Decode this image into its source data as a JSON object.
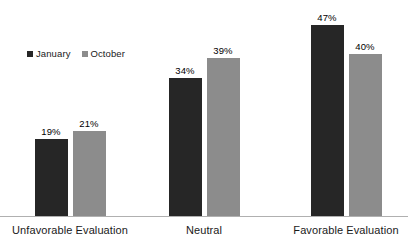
{
  "chart_data": {
    "type": "bar",
    "title": "",
    "subtitle": "",
    "xlabel": "",
    "ylabel": "",
    "ylim": [
      0,
      50
    ],
    "grid": false,
    "legend_position": "top-left",
    "categories": [
      "Unfavorable Evaluation",
      "Neutral",
      "Favorable Evaluation"
    ],
    "series": [
      {
        "name": "January",
        "color": "#262626",
        "values": [
          19,
          34,
          47
        ],
        "labels": [
          "19%",
          "34%",
          "47%"
        ]
      },
      {
        "name": "October",
        "color": "#8c8c8c",
        "values": [
          21,
          39,
          40
        ],
        "labels": [
          "21%",
          "39%",
          "40%"
        ]
      }
    ]
  },
  "legend": {
    "entries": [
      {
        "label": "January",
        "swatch": "legend-swatch-january"
      },
      {
        "label": "October",
        "swatch": "legend-swatch-october"
      }
    ]
  },
  "axis": {
    "baseline_color": "#b0b0b0"
  },
  "colors": {
    "january": "#262626",
    "october": "#8c8c8c",
    "background": "#ffffff",
    "text": "#1a1a1a"
  }
}
